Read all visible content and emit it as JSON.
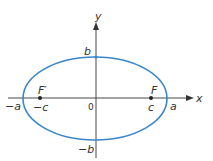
{
  "diagram": {
    "type": "ellipse-foci",
    "colors": {
      "ellipse": "#3a86c8",
      "axes": "#333333",
      "labels": "#333333"
    },
    "axes": {
      "x_label": "x",
      "y_label": "y",
      "origin_label": "0"
    },
    "vertices": {
      "left": "−a",
      "right": "a",
      "top": "b",
      "bottom": "−b"
    },
    "foci": {
      "left": {
        "name": "F′",
        "coord": "−c"
      },
      "right": {
        "name": "F",
        "coord": "c"
      }
    }
  }
}
